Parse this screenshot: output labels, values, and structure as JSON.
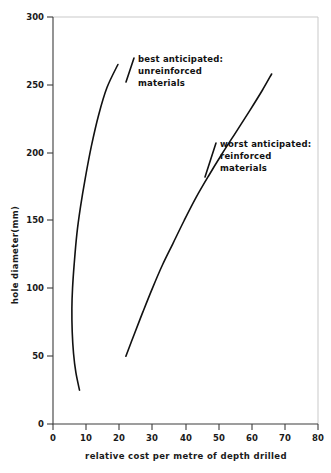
{
  "chart_data": {
    "type": "line",
    "title": "",
    "subtitle": "",
    "xlabel": "relative cost per metre of depth drilled",
    "ylabel": "hole diameter(mm)",
    "xlim": [
      0,
      80
    ],
    "ylim": [
      0,
      300
    ],
    "xticks": [
      0,
      10,
      20,
      30,
      40,
      50,
      60,
      70,
      80
    ],
    "yticks": [
      0,
      50,
      100,
      150,
      200,
      250,
      300
    ],
    "xtick_labels": [
      "0",
      "10",
      "20",
      "30",
      "40",
      "50",
      "60",
      "70",
      "80"
    ],
    "ytick_labels": [
      "0",
      "50",
      "100",
      "150",
      "200",
      "250",
      "300"
    ],
    "grid": false,
    "legend_position": "inline-annotations",
    "series": [
      {
        "name": "best anticipated: unreinforced materials",
        "color": "#111111",
        "x": [
          8.0,
          6.9,
          6.2,
          5.8,
          5.7,
          5.9,
          6.4,
          7.2,
          8.3,
          9.8,
          11.6,
          13.8,
          16.3,
          19.6
        ],
        "y": [
          25,
          38,
          52,
          68,
          85,
          100,
          118,
          140,
          160,
          182,
          205,
          228,
          248,
          265
        ]
      },
      {
        "name": "worst anticipated: reinforced materials",
        "color": "#111111",
        "x": [
          22.0,
          24.5,
          27.2,
          30.0,
          33.0,
          36.2,
          39.6,
          43.2,
          47.0,
          51.0,
          55.2,
          59.4,
          63.2,
          66.0
        ],
        "y": [
          50,
          66,
          83,
          100,
          117,
          133,
          150,
          167,
          183,
          199,
          215,
          231,
          246,
          258
        ]
      }
    ],
    "annotations": [
      {
        "id": "best-anticipated-annotation",
        "lines": [
          "best anticipated:",
          "unreinforced",
          "materials"
        ],
        "x_px": 136,
        "y_px": 62
      },
      {
        "id": "worst-anticipated-annotation",
        "lines": [
          "worst anticipated:",
          "reinforced",
          "materials"
        ],
        "x_px": 218,
        "y_px": 147
      }
    ]
  }
}
